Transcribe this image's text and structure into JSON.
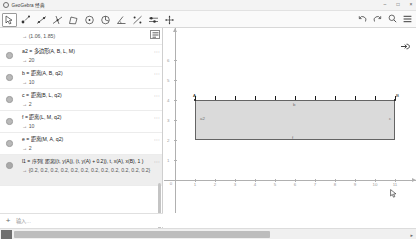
{
  "window": {
    "title": "GeoGebra 经典",
    "logo_icon": "geogebra-logo-icon",
    "minimize_label": "–",
    "maximize_label": "□",
    "close_label": "×"
  },
  "toolbar": {
    "tools": [
      {
        "name": "move-tool",
        "label": "Move",
        "active": true
      },
      {
        "name": "point-tool",
        "label": "Point",
        "active": false
      },
      {
        "name": "line-tool",
        "label": "Line",
        "active": false
      },
      {
        "name": "perpendicular-line-tool",
        "label": "Perpendicular Line",
        "active": false
      },
      {
        "name": "polygon-tool",
        "label": "Polygon",
        "active": false
      },
      {
        "name": "circle-tool",
        "label": "Circle",
        "active": false
      },
      {
        "name": "ellipse-tool",
        "label": "Conic",
        "active": false
      },
      {
        "name": "angle-tool",
        "label": "Angle",
        "active": false
      },
      {
        "name": "reflect-tool",
        "label": "Reflect",
        "active": false
      },
      {
        "name": "slider-tool",
        "label": "Slider",
        "active": false
      },
      {
        "name": "move-graphics-tool",
        "label": "Move Graphics View",
        "active": false
      }
    ],
    "right_icons": [
      {
        "name": "undo-icon",
        "label": "Undo"
      },
      {
        "name": "redo-icon",
        "label": "Redo"
      },
      {
        "name": "search-icon",
        "label": "Search"
      },
      {
        "name": "menu-icon",
        "label": "Menu"
      }
    ]
  },
  "algebra": {
    "panel_style_icon": "algebra-description-icon",
    "rows": [
      {
        "expr": "",
        "result": "→  (1.06, 1.85)",
        "selected": false,
        "first": true
      },
      {
        "expr": "a2 = 多边形(A, B, L, M)",
        "result": "→  20",
        "selected": false
      },
      {
        "expr": "b = 距离(A, B, q2)",
        "result": "→  10",
        "selected": false
      },
      {
        "expr": "c = 距离(B, L, q2)",
        "result": "→  2",
        "selected": false
      },
      {
        "expr": "f = 距离(L, M, q2)",
        "result": "→  10",
        "selected": false
      },
      {
        "expr": "e = 距离(M, A, q2)",
        "result": "→  2",
        "selected": false
      },
      {
        "expr": "l1 = 序列( 距离((t, y(A)), (t, y(A) + 0.2)), t, x(A), x(B), 1 )",
        "result": "→  {0.2, 0.2, 0.2, 0.2, 0.2, 0.2, 0.2, 0.2, 0.2, 0.2, 0.2, 0.2}",
        "selected": true,
        "tall": true
      }
    ],
    "input": {
      "plus_label": "+",
      "placeholder": "输入…"
    }
  },
  "graphics": {
    "x_ticks": [
      "1",
      "2",
      "3",
      "4",
      "5",
      "6",
      "7",
      "8",
      "9",
      "10",
      "11"
    ],
    "y_ticks": [
      "1",
      "2",
      "3",
      "4",
      "5",
      "6"
    ],
    "origin_label": "0",
    "polygon_label": "a2",
    "points": [
      {
        "name": "A",
        "label": "A"
      },
      {
        "name": "B",
        "label": "B"
      },
      {
        "name": "L",
        "label": "L"
      },
      {
        "name": "M",
        "label": "M"
      }
    ],
    "edge_labels": [
      {
        "name": "b",
        "label": "b"
      },
      {
        "name": "c",
        "label": "c"
      },
      {
        "name": "e",
        "label": "e"
      },
      {
        "name": "f",
        "label": "f"
      }
    ],
    "tick_count": 11,
    "pan_icon": "pan-hand-icon",
    "cursor_icon": "pointer-arrow-icon"
  },
  "scrollbar": {
    "left_icon": "scroll-left-icon",
    "right_icon": "scroll-right-icon"
  },
  "colors": {
    "polygon_fill": "#d4d4d4",
    "polygon_stroke": "#4a4a4a",
    "axis": "#b0b0b0",
    "panel_border": "#cfcfcf",
    "selected_row": "#eeeeee"
  }
}
